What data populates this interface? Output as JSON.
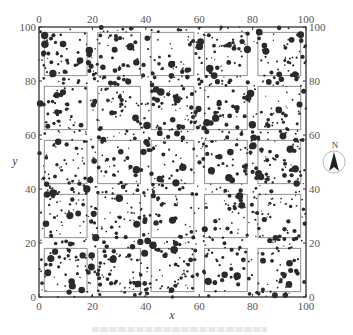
{
  "figure": {
    "type": "stem-map",
    "plot_extent_m": {
      "x": [
        0,
        100
      ],
      "y": [
        0,
        100
      ]
    },
    "grid": {
      "cell_size_m": 20,
      "rows": 5,
      "cols": 5,
      "inner_square_size_m": 16
    },
    "x_axis": {
      "label": "x",
      "ticks": [
        "0",
        "20",
        "40",
        "60",
        "80",
        "100"
      ]
    },
    "y_axis": {
      "label": "y",
      "ticks": [
        "0",
        "20",
        "40",
        "60",
        "80",
        "100"
      ]
    },
    "top_ticks": [
      "0",
      "20",
      "40",
      "60",
      "80",
      "100"
    ],
    "right_ticks": [
      "0",
      "20",
      "40",
      "60",
      "80",
      "100"
    ],
    "north_arrow": {
      "label": "N",
      "icon": "north-arrow-icon"
    },
    "colors": {
      "points": "#2a2a2a",
      "frame": "#333333",
      "inner_squares": "#9a9a9a",
      "ticks": "#555555"
    },
    "points_description": "Tree locations (black dots, size proportional to stem diameter) scattered across plot",
    "point_count_estimate": 1400
  }
}
